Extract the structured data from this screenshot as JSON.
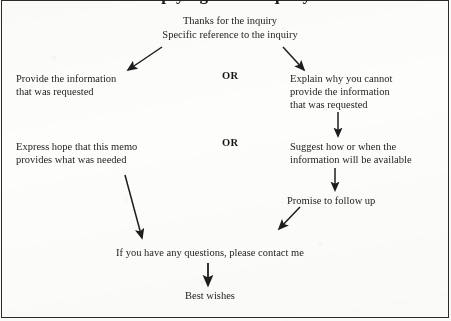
{
  "document": {
    "title_partial": "Replying to an inquiry",
    "type": "flowchart"
  },
  "header": {
    "line1": "Thanks for the inquiry",
    "line2": "Specific reference to the inquiry"
  },
  "branches": {
    "or_label_1": "OR",
    "or_label_2": "OR",
    "left": {
      "step1": "Provide the information\nthat was requested",
      "step2": "Express hope that this memo\nprovides what was needed"
    },
    "right": {
      "step1": "Explain why you cannot\nprovide the information\nthat was requested",
      "step2": "Suggest how or when the\ninformation will be available",
      "step3": "Promise to follow up"
    }
  },
  "closing": {
    "contact": "If you have any questions, please contact me",
    "signoff": "Best wishes"
  },
  "style": {
    "ink": "#1d1d1d",
    "paper": "#fdfdfb",
    "border": "#2b2b2b"
  }
}
